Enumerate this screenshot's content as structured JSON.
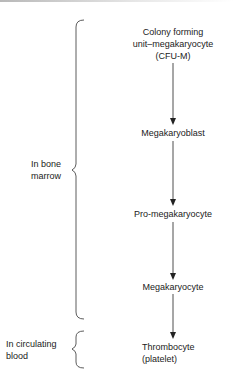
{
  "diagram": {
    "nodes": [
      {
        "id": "cfu-m",
        "lines": [
          "Colony forming",
          "unit–megakaryocyte",
          "(CFU-M)"
        ]
      },
      {
        "id": "megakaryoblast",
        "lines": [
          "Megakaryoblast"
        ]
      },
      {
        "id": "pro-megakaryocyte",
        "lines": [
          "Pro-megakaryocyte"
        ]
      },
      {
        "id": "megakaryocyte",
        "lines": [
          "Megakaryocyte"
        ]
      },
      {
        "id": "thrombocyte",
        "lines": [
          "Thrombocyte",
          "(platelet)"
        ]
      }
    ],
    "edges": [
      {
        "from": "cfu-m",
        "to": "megakaryoblast"
      },
      {
        "from": "megakaryoblast",
        "to": "pro-megakaryocyte"
      },
      {
        "from": "pro-megakaryocyte",
        "to": "megakaryocyte"
      },
      {
        "from": "megakaryocyte",
        "to": "thrombocyte"
      }
    ],
    "groups": [
      {
        "id": "bone-marrow",
        "lines": [
          "In bone",
          "marrow"
        ],
        "spans": [
          "cfu-m",
          "megakaryocyte"
        ]
      },
      {
        "id": "circulating-blood",
        "lines": [
          "In circulating",
          "blood"
        ],
        "spans": [
          "thrombocyte"
        ]
      }
    ]
  }
}
